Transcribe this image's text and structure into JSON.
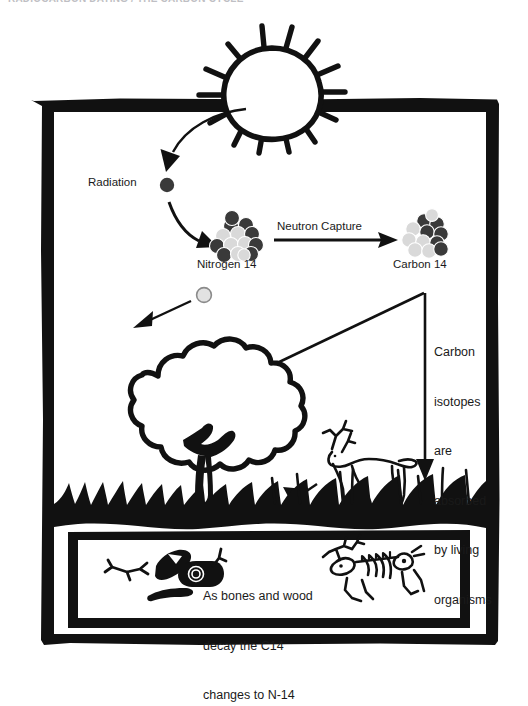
{
  "page": {
    "top_caption": "RADIOCARBON DATING / THE CARBON CYCLE",
    "width": 528,
    "height": 676
  },
  "palette": {
    "ink": "#111111",
    "paper": "#ffffff",
    "nucleon_dark": "#3a3a3a",
    "nucleon_light": "#d9d9d9",
    "label_gray": "#1a1a1a"
  },
  "diagram": {
    "labels": {
      "radiation": "Radiation",
      "nitrogen": "Nitrogen 14",
      "carbon": "Carbon 14",
      "neutron_capture": "Neutron Capture",
      "absorbed": "Carbon isotopes are absorbed by living organisms",
      "decay": "As bones and wood decay the C14 changes to N-14"
    },
    "absorbed_lines": [
      "Carbon",
      "isotopes",
      "are",
      "absorbed",
      "by living",
      "organisms"
    ],
    "decay_lines": [
      "As bones and wood",
      "decay the C14",
      "changes to N-14"
    ],
    "elements": [
      {
        "name": "sun",
        "kind": "illustration",
        "label": ""
      },
      {
        "name": "cosmic-ray-arrow",
        "kind": "arrow",
        "label": ""
      },
      {
        "name": "radiation-particle",
        "kind": "particle",
        "label": "Radiation"
      },
      {
        "name": "nitrogen-14-nucleus",
        "kind": "nucleus",
        "label": "Nitrogen 14"
      },
      {
        "name": "neutron-capture-arrow",
        "kind": "arrow",
        "label": "Neutron Capture"
      },
      {
        "name": "carbon-14-nucleus",
        "kind": "nucleus",
        "label": "Carbon 14"
      },
      {
        "name": "neutron-particle",
        "kind": "particle",
        "label": ""
      },
      {
        "name": "tree",
        "kind": "illustration",
        "label": ""
      },
      {
        "name": "deer",
        "kind": "illustration",
        "label": ""
      },
      {
        "name": "grass-ground",
        "kind": "illustration",
        "label": ""
      },
      {
        "name": "buried-wood",
        "kind": "illustration",
        "label": ""
      },
      {
        "name": "buried-skeleton",
        "kind": "illustration",
        "label": ""
      }
    ]
  }
}
